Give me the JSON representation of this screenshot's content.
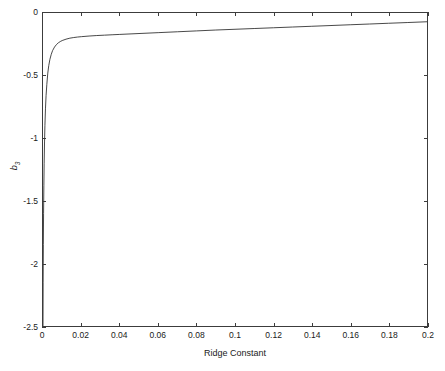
{
  "chart_data": {
    "type": "line",
    "title": "",
    "xlabel": "Ridge Constant",
    "ylabel": "b",
    "ylabel_subscript": "3",
    "xlim": [
      0,
      0.2
    ],
    "ylim": [
      -2.5,
      0
    ],
    "grid": false,
    "legend": null,
    "xticks": [
      0,
      0.02,
      0.04,
      0.06,
      0.08,
      0.1,
      0.12,
      0.14,
      0.16,
      0.18,
      0.2
    ],
    "xticklabels": [
      "0",
      "0.02",
      "0.04",
      "0.06",
      "0.08",
      "0.1",
      "0.12",
      "0.14",
      "0.16",
      "0.18",
      "0.2"
    ],
    "yticks": [
      0,
      -0.5,
      -1,
      -1.5,
      -2,
      -2.5
    ],
    "yticklabels": [
      "0",
      "-0.5",
      "-1",
      "-1.5",
      "-2",
      "-2.5"
    ],
    "line_color": "#1a1a1a",
    "line_width": 0.8,
    "series": [
      {
        "name": "b3 vs ridge constant",
        "x": [
          0.0,
          8e-05,
          0.00018,
          0.0003,
          0.00045,
          0.0006,
          0.0008,
          0.001,
          0.0013,
          0.0016,
          0.002,
          0.0025,
          0.003,
          0.0036,
          0.0043,
          0.005,
          0.006,
          0.007,
          0.008,
          0.009,
          0.01,
          0.012,
          0.014,
          0.016,
          0.018,
          0.02,
          0.024,
          0.028,
          0.032,
          0.036,
          0.04,
          0.05,
          0.06,
          0.07,
          0.08,
          0.09,
          0.1,
          0.11,
          0.12,
          0.13,
          0.14,
          0.15,
          0.16,
          0.17,
          0.18,
          0.19,
          0.2
        ],
        "y": [
          -2.5,
          -2.15,
          -1.85,
          -1.6,
          -1.38,
          -1.2,
          -1.03,
          -0.9,
          -0.76,
          -0.66,
          -0.57,
          -0.48,
          -0.42,
          -0.37,
          -0.33,
          -0.3,
          -0.272,
          -0.252,
          -0.238,
          -0.228,
          -0.22,
          -0.209,
          -0.201,
          -0.196,
          -0.192,
          -0.189,
          -0.184,
          -0.18,
          -0.177,
          -0.174,
          -0.171,
          -0.164,
          -0.157,
          -0.15,
          -0.143,
          -0.136,
          -0.13,
          -0.124,
          -0.118,
          -0.112,
          -0.106,
          -0.1,
          -0.094,
          -0.088,
          -0.082,
          -0.076,
          -0.07
        ]
      }
    ]
  },
  "axes": {
    "xlabel_text": "Ridge Constant",
    "ylabel_text": "b"
  }
}
